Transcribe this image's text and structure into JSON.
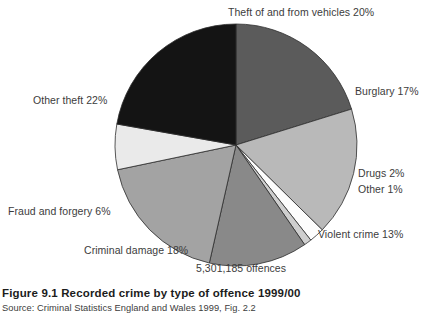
{
  "figure": {
    "caption": "Figure 9.1  Recorded crime by type of offence 1999/00",
    "source": "Source:  Criminal Statistics England and Wales 1999, Fig. 2.2",
    "total_label": "5,301,185 offences"
  },
  "labels": {
    "vehicles": "Theft of and from vehicles  20%",
    "burglary": "Burglary  17%",
    "drugs": "Drugs  2%",
    "other": "Other  1%",
    "violent": "Violent crime  13%",
    "criminal_damage": "Criminal damage  18%",
    "fraud": "Fraud and forgery  6%",
    "other_theft": "Other theft  22%"
  },
  "chart_data": {
    "type": "pie",
    "title": "Figure 9.1  Recorded crime by type of offence 1999/00",
    "subtitle": "5,301,185 offences",
    "unit": "percent of recorded offences",
    "total_offences": 5301185,
    "legend_position": "around-slices",
    "start_angle_deg": 0,
    "direction": "clockwise",
    "categories": [
      "Theft of and from vehicles",
      "Burglary",
      "Drugs",
      "Other",
      "Violent crime",
      "Criminal damage",
      "Fraud and forgery",
      "Other theft"
    ],
    "values": [
      20,
      17,
      2,
      1,
      13,
      18,
      6,
      22
    ],
    "colors": [
      "#5b5b5b",
      "#b9b9b9",
      "#fdfdfd",
      "#cfcfcf",
      "#898989",
      "#a3a3a3",
      "#eaeaea",
      "#141414"
    ],
    "slices": [
      {
        "label": "Theft of and from vehicles",
        "value": 20,
        "color": "#5b5b5b"
      },
      {
        "label": "Burglary",
        "value": 17,
        "color": "#b9b9b9"
      },
      {
        "label": "Drugs",
        "value": 2,
        "color": "#fdfdfd"
      },
      {
        "label": "Other",
        "value": 1,
        "color": "#cfcfcf"
      },
      {
        "label": "Violent crime",
        "value": 13,
        "color": "#898989"
      },
      {
        "label": "Criminal damage",
        "value": 18,
        "color": "#a3a3a3"
      },
      {
        "label": "Fraud and forgery",
        "value": 6,
        "color": "#eaeaea"
      },
      {
        "label": "Other theft",
        "value": 22,
        "color": "#141414"
      }
    ]
  },
  "geometry": {
    "cx": 236,
    "cy": 145,
    "r": 121,
    "stroke": "#2d2d2d",
    "stroke_width": 0.8
  }
}
